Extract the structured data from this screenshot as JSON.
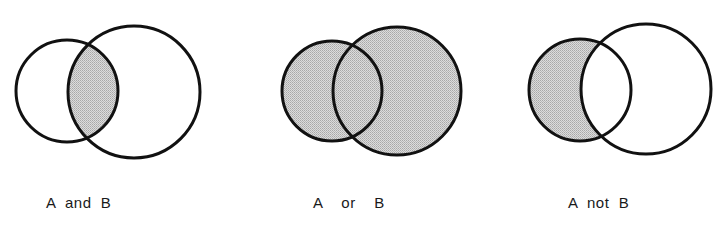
{
  "diagrams": [
    {
      "label": "A  and  B",
      "operation": "intersection",
      "circle_a": {
        "cx": 67,
        "cy": 91,
        "r": 51
      },
      "circle_b": {
        "cx": 134,
        "cy": 92,
        "r": 66
      },
      "shaded": "A∩B"
    },
    {
      "label": "A    or    B",
      "operation": "union",
      "circle_a": {
        "cx": 332,
        "cy": 91,
        "r": 50
      },
      "circle_b": {
        "cx": 397,
        "cy": 91,
        "r": 64
      },
      "shaded": "A∪B"
    },
    {
      "label": "A  not  B",
      "operation": "difference",
      "circle_a": {
        "cx": 580,
        "cy": 90,
        "r": 51
      },
      "circle_b": {
        "cx": 646,
        "cy": 89,
        "r": 65
      },
      "shaded": "A−B"
    }
  ],
  "colors": {
    "stroke": "#111111",
    "shade": "#c9c9c9",
    "background": "#ffffff"
  }
}
